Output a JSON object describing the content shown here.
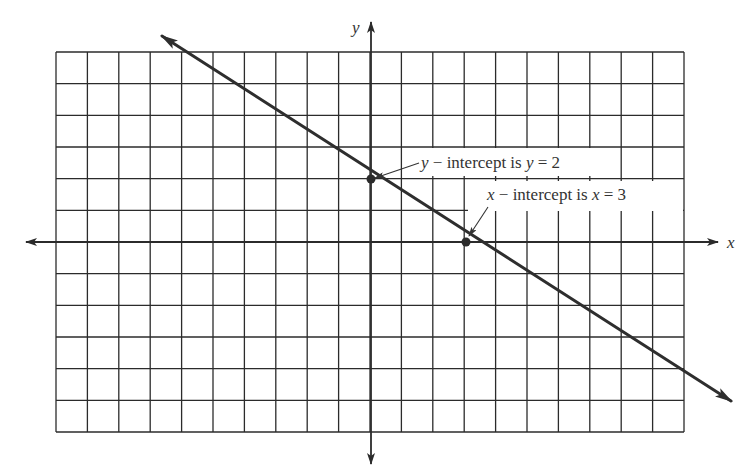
{
  "chart_data": {
    "type": "line",
    "title": "",
    "xlabel": "x",
    "ylabel": "y",
    "xlim": [
      -10,
      10
    ],
    "ylim": [
      -6,
      6
    ],
    "grid": true,
    "grid_step": 1,
    "tick_labels": false,
    "series": [
      {
        "name": "line",
        "equation": "y = -2/3 x + 2",
        "slope": -0.6667,
        "intercept": 2,
        "arrows": "both",
        "x": [
          -6.5,
          10.5
        ],
        "y": [
          6.33,
          -5
        ]
      }
    ],
    "points": [
      {
        "name": "y-intercept",
        "x": 0,
        "y": 2
      },
      {
        "name": "x-intercept",
        "x": 3,
        "y": 0
      }
    ],
    "annotations": [
      {
        "target": "y-intercept",
        "text": "y − intercept is y = 2"
      },
      {
        "target": "x-intercept",
        "text": "x − intercept is x = 3"
      }
    ]
  },
  "axes": {
    "x_label": "x",
    "y_label": "y"
  },
  "annotations": {
    "y_intercept": {
      "var1": "y",
      "mid": " − intercept is ",
      "var2": "y",
      "eq": " = 2"
    },
    "x_intercept": {
      "var1": "x",
      "mid": " − intercept is ",
      "var2": "x",
      "eq": " = 3"
    }
  },
  "colors": {
    "ink": "#2b2b2b",
    "background": "#ffffff"
  }
}
